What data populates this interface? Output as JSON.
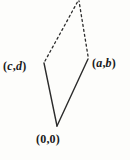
{
  "figure": {
    "type": "vector-parallelogram-diagram",
    "background_color": "#fdfdfb",
    "stroke_color": "#2b2b2b",
    "vertices": [
      {
        "name": "origin",
        "label_open": "(",
        "label_x": "0",
        "label_sep": ",",
        "label_y": "0",
        "label_close": ")",
        "x": 57,
        "y": 126
      },
      {
        "name": "vector-cd",
        "label_open": "(",
        "label_x": "c",
        "label_sep": ",",
        "label_y": "d",
        "label_close": ")",
        "x": 44,
        "y": 63
      },
      {
        "name": "vector-ab",
        "label_open": "(",
        "label_x": "a",
        "label_sep": ",",
        "label_y": "b",
        "label_close": ")",
        "x": 88,
        "y": 58
      },
      {
        "name": "sum-apex",
        "label_open": "",
        "label_x": "",
        "label_sep": "",
        "label_y": "",
        "label_close": "",
        "x": 78,
        "y": 1
      }
    ],
    "edges": [
      {
        "name": "origin-to-cd",
        "style": "solid",
        "from": "origin",
        "to": "vector-cd"
      },
      {
        "name": "origin-to-ab",
        "style": "solid",
        "from": "origin",
        "to": "vector-ab"
      },
      {
        "name": "cd-to-apex",
        "style": "dashed",
        "from": "vector-cd",
        "to": "sum-apex"
      },
      {
        "name": "ab-to-apex",
        "style": "dashed",
        "from": "vector-ab",
        "to": "sum-apex"
      }
    ],
    "labels": {
      "cd": {
        "open": "(",
        "x": "c",
        "sep": ",",
        "y": "d",
        "close": ")"
      },
      "ab": {
        "open": "(",
        "x": "a",
        "sep": ",",
        "y": "b",
        "close": ")"
      },
      "origin": {
        "open": "(",
        "x": "0",
        "sep": ",",
        "y": "0",
        "close": ")"
      }
    }
  }
}
